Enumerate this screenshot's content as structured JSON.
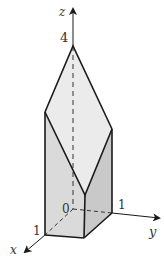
{
  "figure": {
    "axes": {
      "x": {
        "label": "x",
        "tick": "1"
      },
      "y": {
        "label": "y",
        "tick": "1"
      },
      "z": {
        "label": "z",
        "tick": "4"
      },
      "origin": "0"
    },
    "colors": {
      "stroke": "#1a1a1a",
      "axis": "#333333",
      "top_face": "#ebebeb",
      "left_face": "#dadada",
      "right_face": "#c9c9c9"
    }
  }
}
